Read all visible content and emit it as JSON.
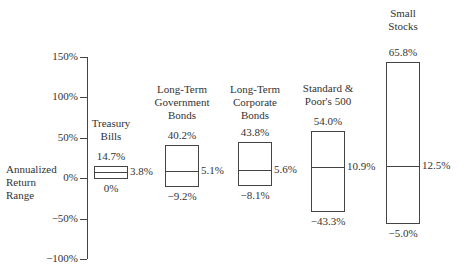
{
  "chart_data": {
    "type": "range",
    "title": "",
    "ylabel": "Annualized Return Range",
    "xlabel": "",
    "ylim": [
      -100,
      150
    ],
    "yticks": [
      150,
      100,
      50,
      0,
      -50,
      -100
    ],
    "ytick_labels": [
      "150%",
      "100%",
      "50%",
      "0%",
      "−50%",
      "−100%"
    ],
    "grid": false,
    "legend": null,
    "categories": [
      "Treasury Bills",
      "Long-Term Government Bonds",
      "Long-Term Corporate Bonds",
      "Standard & Poor's 500",
      "Small Stocks"
    ],
    "series": [
      {
        "name": "High",
        "values": [
          14.7,
          40.2,
          43.8,
          54.0,
          65.8
        ]
      },
      {
        "name": "Average",
        "values": [
          3.8,
          5.1,
          5.6,
          10.9,
          12.5
        ]
      },
      {
        "name": "Low",
        "values": [
          0,
          -9.2,
          -8.1,
          -43.3,
          -5.0
        ]
      }
    ],
    "items": [
      {
        "label_lines": [
          "Treasury",
          "Bills"
        ],
        "high": "14.7%",
        "avg": "3.8%",
        "low": "0%"
      },
      {
        "label_lines": [
          "Long-Term",
          "Government",
          "Bonds"
        ],
        "high": "40.2%",
        "avg": "5.1%",
        "low": "−9.2%"
      },
      {
        "label_lines": [
          "Long-Term",
          "Corporate",
          "Bonds"
        ],
        "high": "43.8%",
        "avg": "5.6%",
        "low": "−8.1%"
      },
      {
        "label_lines": [
          "Standard &",
          "Poor's 500"
        ],
        "high": "54.0%",
        "avg": "10.9%",
        "low": "−43.3%"
      },
      {
        "label_lines": [
          "Small",
          "Stocks"
        ],
        "high": "65.8%",
        "avg": "12.5%",
        "low": "−5.0%"
      }
    ]
  },
  "axis": {
    "ylabel_lines": [
      "Annualized",
      "Return",
      "Range"
    ]
  }
}
